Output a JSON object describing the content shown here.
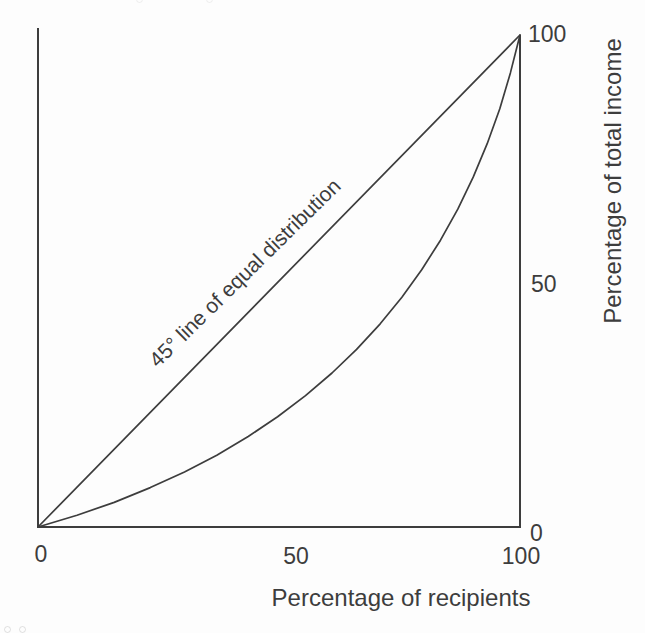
{
  "figure": {
    "background": "#fdfdfd",
    "ink_color": "#3d3d3d"
  },
  "chart_data": {
    "type": "line",
    "title": "",
    "xlabel": "Percentage of recipients",
    "ylabel": "Percentage of total income",
    "x_range": [
      0,
      100
    ],
    "y_range": [
      0,
      100
    ],
    "x_tick_labels": [
      "0",
      "50",
      "100"
    ],
    "x_tick_values": [
      0,
      50,
      100
    ],
    "y_tick_labels": [
      "0",
      "50",
      "100"
    ],
    "y_tick_values": [
      0,
      50,
      100
    ],
    "y_axis_side": "right",
    "grid": false,
    "legend": "none",
    "annotation": "45° line of equal distribution",
    "series": [
      {
        "name": "45-degree line of equal distribution",
        "points": [
          [
            0,
            0
          ],
          [
            100,
            100
          ]
        ]
      },
      {
        "name": "Lorenz curve",
        "points": [
          [
            0,
            0
          ],
          [
            8.1,
            2.4
          ],
          [
            15.8,
            5.0
          ],
          [
            23.3,
            8.0
          ],
          [
            30.4,
            11.2
          ],
          [
            37.1,
            14.6
          ],
          [
            43.6,
            18.4
          ],
          [
            49.7,
            22.4
          ],
          [
            55.5,
            26.7
          ],
          [
            61.0,
            31.3
          ],
          [
            66.1,
            36.1
          ],
          [
            71.0,
            41.3
          ],
          [
            75.5,
            46.7
          ],
          [
            79.6,
            52.3
          ],
          [
            83.5,
            58.3
          ],
          [
            87.1,
            64.6
          ],
          [
            90.3,
            71.1
          ],
          [
            93.2,
            77.9
          ],
          [
            95.8,
            85.0
          ],
          [
            98.0,
            92.3
          ],
          [
            100,
            100
          ]
        ]
      }
    ]
  }
}
